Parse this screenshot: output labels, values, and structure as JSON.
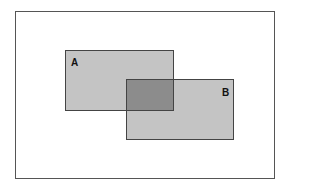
{
  "diagram": {
    "type": "overlapping-rectangles",
    "shapes": [
      {
        "id": "A",
        "label": "A",
        "fill": "#c4c4c4"
      },
      {
        "id": "B",
        "label": "B",
        "fill": "#c4c4c4"
      }
    ],
    "intersection": {
      "label": "",
      "fill": "#8c8c8c"
    },
    "colors": {
      "frame": "#555555",
      "border": "#444444",
      "background": "#ffffff"
    }
  }
}
